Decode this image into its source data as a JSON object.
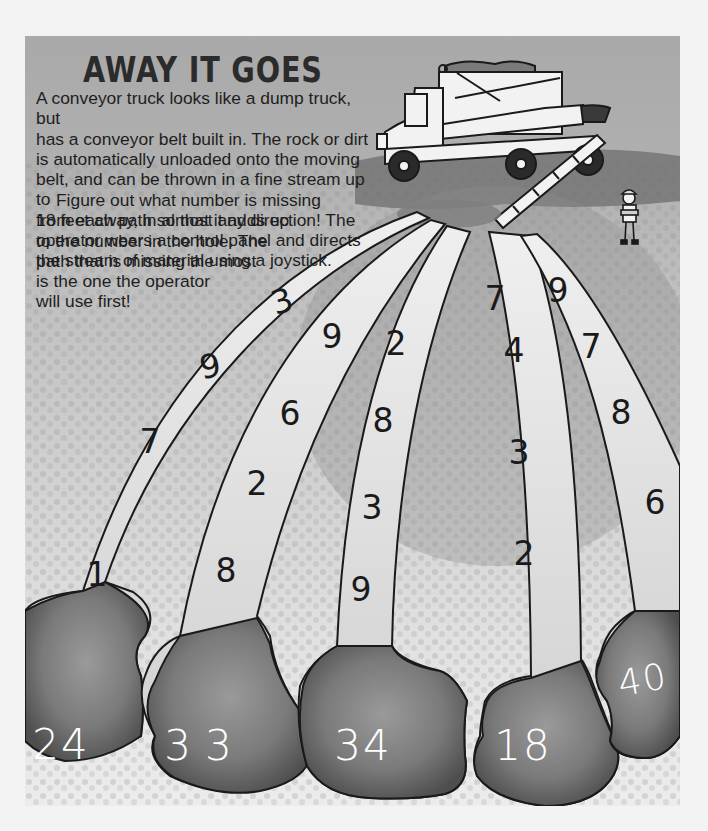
{
  "page": {
    "title": "AWAY IT GOES",
    "intro_text": "A conveyor truck looks like a dump truck, but has a conveyor belt built in. The rock or dirt is automatically unloaded onto the moving belt, and can be thrown in a fine stream up to 18 feet away, in almost any direction! The operator wears a control panel and directs the stream of material using a joystick.",
    "intro_lines": [
      "A conveyor truck looks like a dump truck, but",
      "has a conveyor belt built in. The rock or dirt",
      "is automatically unloaded onto the moving",
      "belt, and can be thrown in a fine stream up to",
      "18 feet away, in almost any direction! The",
      "operator wears a control panel and directs",
      "the stream of material using a joystick."
    ],
    "instruction_lines": [
      "Figure out what number is missing",
      "from each path so that it adds up",
      "to the number in the hole. The",
      "path that is missing the most",
      "is the one the operator",
      "will use first!"
    ]
  },
  "illustration": {
    "truck": "conveyor-truck",
    "operator": "worker-with-control-panel"
  },
  "paths": [
    {
      "id": 1,
      "numbers": [
        "3",
        "9",
        "7",
        "1"
      ],
      "hole_total": "24"
    },
    {
      "id": 2,
      "numbers": [
        "9",
        "6",
        "2",
        "8"
      ],
      "hole_total": "33"
    },
    {
      "id": 3,
      "numbers": [
        "2",
        "8",
        "3",
        "9"
      ],
      "hole_total": "34"
    },
    {
      "id": 4,
      "numbers": [
        "7",
        "4",
        "3",
        "2"
      ],
      "hole_total": "18"
    },
    {
      "id": 5,
      "numbers": [
        "9",
        "7",
        "8",
        "6"
      ],
      "hole_total": "40"
    }
  ],
  "colors": {
    "sky": "#a9a9a9",
    "path_fill": "#ececec",
    "hole_fill": "#6a6a6a",
    "outline": "#1a1a1a",
    "page_bg": "#f3f3f3"
  }
}
